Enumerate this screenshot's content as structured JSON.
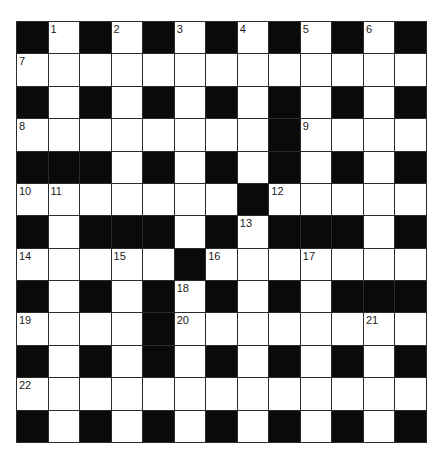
{
  "puzzle": {
    "rows": 13,
    "cols": 13,
    "layout": [
      "#.#.#.#.#.#.#",
      ".............",
      "#.#.#.#.#.#.#",
      "........#....",
      "###.#.#.#.#.#",
      ".......#.....",
      "#.###.#.###.#",
      ".....#.......",
      "#.#.#.#.#.###",
      "....#........",
      "#.#.#.#.#.#.#",
      ".............",
      "#.#.#.#.#.#.#"
    ],
    "numbers": [
      {
        "row": 0,
        "col": 1,
        "n": "1"
      },
      {
        "row": 0,
        "col": 3,
        "n": "2"
      },
      {
        "row": 0,
        "col": 5,
        "n": "3"
      },
      {
        "row": 0,
        "col": 7,
        "n": "4"
      },
      {
        "row": 0,
        "col": 9,
        "n": "5"
      },
      {
        "row": 0,
        "col": 11,
        "n": "6"
      },
      {
        "row": 1,
        "col": 0,
        "n": "7"
      },
      {
        "row": 3,
        "col": 0,
        "n": "8"
      },
      {
        "row": 3,
        "col": 9,
        "n": "9"
      },
      {
        "row": 5,
        "col": 0,
        "n": "10"
      },
      {
        "row": 5,
        "col": 1,
        "n": "11"
      },
      {
        "row": 5,
        "col": 8,
        "n": "12"
      },
      {
        "row": 6,
        "col": 7,
        "n": "13"
      },
      {
        "row": 7,
        "col": 0,
        "n": "14"
      },
      {
        "row": 7,
        "col": 3,
        "n": "15"
      },
      {
        "row": 7,
        "col": 6,
        "n": "16"
      },
      {
        "row": 7,
        "col": 9,
        "n": "17"
      },
      {
        "row": 8,
        "col": 5,
        "n": "18"
      },
      {
        "row": 9,
        "col": 0,
        "n": "19"
      },
      {
        "row": 9,
        "col": 5,
        "n": "20"
      },
      {
        "row": 9,
        "col": 11,
        "n": "21"
      },
      {
        "row": 11,
        "col": 0,
        "n": "22"
      }
    ],
    "colors": {
      "block": "#0a0a0a",
      "cell": "#ffffff",
      "grid_line": "#2b2b2b",
      "number": "#1a1a1a"
    }
  }
}
